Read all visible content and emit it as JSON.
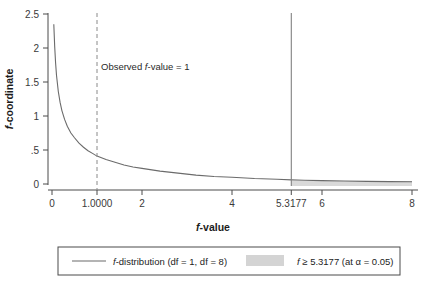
{
  "chart_data": {
    "type": "line",
    "title": "",
    "xlabel": "f-value",
    "ylabel": "f-coordinate",
    "xlim": [
      0,
      8
    ],
    "ylim": [
      0,
      2.5
    ],
    "grid": false,
    "legend_position": "bottom",
    "x_ticks": [
      {
        "value": 0,
        "label": "0"
      },
      {
        "value": 1,
        "label": "1.0000"
      },
      {
        "value": 2,
        "label": "2"
      },
      {
        "value": 4,
        "label": "4"
      },
      {
        "value": 5.3177,
        "label": "5.3177"
      },
      {
        "value": 6,
        "label": "6"
      },
      {
        "value": 8,
        "label": "8"
      }
    ],
    "y_ticks": [
      {
        "value": 0,
        "label": "0"
      },
      {
        "value": 0.5,
        "label": ".5"
      },
      {
        "value": 1,
        "label": "1"
      },
      {
        "value": 1.5,
        "label": "1.5"
      },
      {
        "value": 2,
        "label": "2"
      },
      {
        "value": 2.5,
        "label": "2.5"
      }
    ],
    "series": [
      {
        "name": "f-distribution (df = 1, df = 8)",
        "type": "line",
        "color": "#6b6b6b",
        "x": [
          0.04,
          0.06,
          0.08,
          0.1,
          0.14,
          0.18,
          0.22,
          0.28,
          0.34,
          0.42,
          0.5,
          0.6,
          0.7,
          0.8,
          0.9,
          1.0,
          1.2,
          1.4,
          1.6,
          1.8,
          2.0,
          2.4,
          2.8,
          3.2,
          3.6,
          4.0,
          4.5,
          5.0,
          5.3177,
          5.6,
          6.0,
          6.5,
          7.0,
          7.5,
          8.0
        ],
        "y": [
          2.35,
          2.02,
          1.78,
          1.6,
          1.36,
          1.2,
          1.08,
          0.95,
          0.85,
          0.75,
          0.68,
          0.6,
          0.54,
          0.49,
          0.45,
          0.41,
          0.36,
          0.32,
          0.28,
          0.25,
          0.23,
          0.19,
          0.16,
          0.13,
          0.11,
          0.1,
          0.08,
          0.07,
          0.06,
          0.055,
          0.05,
          0.044,
          0.039,
          0.035,
          0.032
        ]
      }
    ],
    "reference_lines": [
      {
        "name": "observed-f-value",
        "orientation": "vertical",
        "value": 1,
        "style": "dashed",
        "color": "#8a8a8a",
        "annotation": "Observed f-value = 1"
      },
      {
        "name": "critical-f-value",
        "orientation": "vertical",
        "value": 5.3177,
        "style": "solid",
        "color": "#808080"
      }
    ],
    "shaded_region": {
      "name": "rejection-region",
      "from": 5.3177,
      "to": 8,
      "color": "#d9d9d9"
    }
  },
  "annotation": {
    "observed_prefix": "Observed ",
    "observed_italic": "f",
    "observed_suffix": "-value = 1"
  },
  "axis": {
    "x_title_italic": "f",
    "x_title_rest": "-value",
    "y_title_italic": "f",
    "y_title_rest": "-coordinate"
  },
  "legend": {
    "entries": [
      {
        "swatch": "line",
        "swatch_color": "#6b6b6b",
        "italic": "f",
        "text": "-distribution (df = 1, df = 8)"
      },
      {
        "swatch": "box",
        "swatch_color": "#d4d4d4",
        "italic": "f",
        "text": " ≥ 5.3177 (at α = 0.05)"
      }
    ]
  }
}
